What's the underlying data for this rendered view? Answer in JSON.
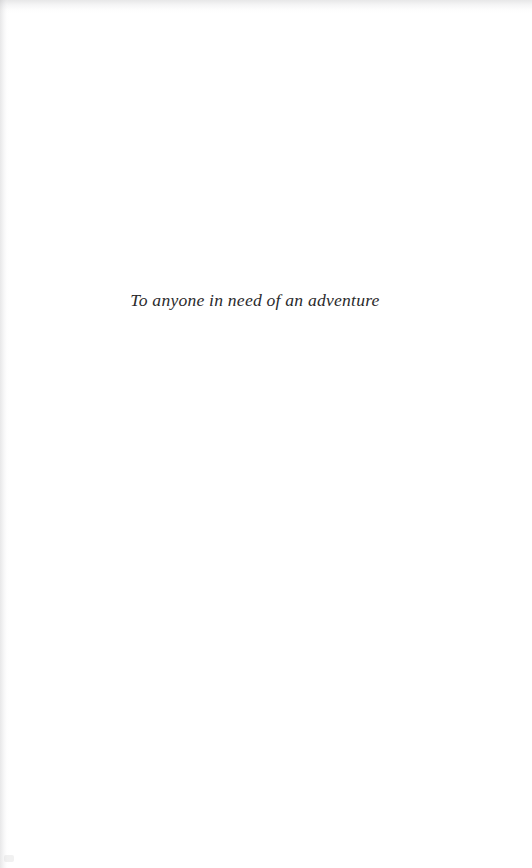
{
  "page": {
    "kind": "book-dedication-page",
    "background_color": "#ffffff",
    "width": 532,
    "height": 868
  },
  "dedication": {
    "text": "To anyone in need of an adventure",
    "style": "italic",
    "color": "#2a2a2c",
    "alignment": "center"
  },
  "artifacts": {
    "top_edge_shadow_color": "#afafb2",
    "left_edge_shadow_color": "#b2b2b5",
    "speck_color": "#bebec1"
  }
}
